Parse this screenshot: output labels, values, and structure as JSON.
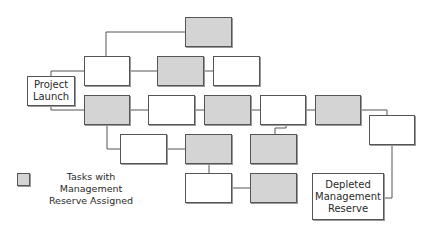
{
  "diagram": {
    "type": "network-diagram",
    "colors": {
      "task_fill": "#ffffff",
      "reserve_fill": "#d4d4d4",
      "border": "#555555",
      "line": "#555555"
    },
    "nodes": [
      {
        "id": "launch",
        "label": "Project\nLaunch",
        "reserve": false,
        "x": 27,
        "y": 76,
        "w": 48,
        "h": 30
      },
      {
        "id": "t1",
        "label": "",
        "reserve": true,
        "x": 185,
        "y": 17,
        "w": 47,
        "h": 30
      },
      {
        "id": "t2",
        "label": "",
        "reserve": false,
        "x": 84,
        "y": 56,
        "w": 46,
        "h": 30
      },
      {
        "id": "t3",
        "label": "",
        "reserve": true,
        "x": 157,
        "y": 56,
        "w": 47,
        "h": 30
      },
      {
        "id": "t4",
        "label": "",
        "reserve": false,
        "x": 213,
        "y": 56,
        "w": 47,
        "h": 30
      },
      {
        "id": "t5",
        "label": "",
        "reserve": true,
        "x": 84,
        "y": 95,
        "w": 46,
        "h": 30
      },
      {
        "id": "t6",
        "label": "",
        "reserve": false,
        "x": 148,
        "y": 95,
        "w": 47,
        "h": 30
      },
      {
        "id": "t7",
        "label": "",
        "reserve": true,
        "x": 204,
        "y": 95,
        "w": 47,
        "h": 30
      },
      {
        "id": "t8",
        "label": "",
        "reserve": false,
        "x": 260,
        "y": 95,
        "w": 46,
        "h": 30
      },
      {
        "id": "t9",
        "label": "",
        "reserve": true,
        "x": 315,
        "y": 95,
        "w": 46,
        "h": 30
      },
      {
        "id": "t10",
        "label": "",
        "reserve": false,
        "x": 369,
        "y": 115,
        "w": 46,
        "h": 30
      },
      {
        "id": "t11",
        "label": "",
        "reserve": false,
        "x": 120,
        "y": 134,
        "w": 47,
        "h": 30
      },
      {
        "id": "t12",
        "label": "",
        "reserve": true,
        "x": 185,
        "y": 134,
        "w": 47,
        "h": 30
      },
      {
        "id": "t13",
        "label": "",
        "reserve": true,
        "x": 250,
        "y": 134,
        "w": 47,
        "h": 30
      },
      {
        "id": "t14",
        "label": "",
        "reserve": false,
        "x": 185,
        "y": 173,
        "w": 47,
        "h": 30
      },
      {
        "id": "t15",
        "label": "",
        "reserve": true,
        "x": 250,
        "y": 173,
        "w": 47,
        "h": 30
      },
      {
        "id": "depleted",
        "label": "Depleted\nManagement\nReserve",
        "reserve": false,
        "x": 312,
        "y": 173,
        "w": 72,
        "h": 47
      }
    ],
    "edges": [
      {
        "from": "launch",
        "to": "t2",
        "points": [
          [
            51,
            76
          ],
          [
            51,
            71
          ],
          [
            84,
            71
          ]
        ]
      },
      {
        "from": "launch",
        "to": "t5",
        "points": [
          [
            51,
            106
          ],
          [
            51,
            110
          ],
          [
            84,
            110
          ]
        ]
      },
      {
        "from": "t2",
        "to": "t1",
        "points": [
          [
            106,
            56
          ],
          [
            106,
            32
          ],
          [
            185,
            32
          ]
        ]
      },
      {
        "from": "t2",
        "to": "t3",
        "points": [
          [
            130,
            71
          ],
          [
            157,
            71
          ]
        ]
      },
      {
        "from": "t3",
        "to": "t4",
        "points": [
          [
            204,
            71
          ],
          [
            213,
            71
          ]
        ]
      },
      {
        "from": "t5",
        "to": "t6",
        "points": [
          [
            130,
            110
          ],
          [
            148,
            110
          ]
        ]
      },
      {
        "from": "t6",
        "to": "t7",
        "points": [
          [
            195,
            110
          ],
          [
            204,
            110
          ]
        ]
      },
      {
        "from": "t7",
        "to": "t8",
        "points": [
          [
            251,
            110
          ],
          [
            260,
            110
          ]
        ]
      },
      {
        "from": "t8",
        "to": "t9",
        "points": [
          [
            306,
            110
          ],
          [
            315,
            110
          ]
        ]
      },
      {
        "from": "t9",
        "to": "t10",
        "points": [
          [
            361,
            110
          ],
          [
            387,
            110
          ],
          [
            387,
            115
          ]
        ]
      },
      {
        "from": "t5",
        "to": "t11",
        "points": [
          [
            107,
            125
          ],
          [
            107,
            149
          ],
          [
            120,
            149
          ]
        ]
      },
      {
        "from": "t11",
        "to": "t12",
        "points": [
          [
            167,
            149
          ],
          [
            185,
            149
          ]
        ]
      },
      {
        "from": "t8",
        "to": "t13",
        "points": [
          [
            286,
            125
          ],
          [
            286,
            128
          ],
          [
            275,
            128
          ],
          [
            275,
            134
          ]
        ]
      },
      {
        "from": "t12",
        "to": "t14",
        "points": [
          [
            209,
            164
          ],
          [
            209,
            173
          ]
        ]
      },
      {
        "from": "t14",
        "to": "t15",
        "points": [
          [
            232,
            188
          ],
          [
            250,
            188
          ]
        ]
      },
      {
        "from": "t10",
        "to": "depleted",
        "points": [
          [
            392,
            145
          ],
          [
            392,
            198
          ],
          [
            384,
            198
          ]
        ]
      }
    ]
  },
  "legend": {
    "label": "Tasks with Management\nReserve Assigned"
  }
}
